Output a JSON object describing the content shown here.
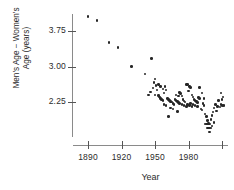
{
  "chart_data": {
    "type": "scatter",
    "title": "",
    "xlabel": "Year",
    "ylabel": "Men's Age − Women's Age (years)",
    "ylabel_line1": "Men's Age − Women's",
    "ylabel_line2": "Age (years)",
    "xticks": [
      1890,
      1920,
      1950,
      1980,
      2010
    ],
    "xtick_labels": [
      "1890",
      "1920",
      "1950",
      "1980",
      ""
    ],
    "yticks": [
      2.25,
      3.0,
      3.75
    ],
    "ytick_labels": [
      "2.25",
      "3.00",
      "3.75"
    ],
    "xlim": [
      1878,
      2014
    ],
    "ylim": [
      1.52,
      4.22
    ],
    "grid": false,
    "legend": false,
    "point_color": "#262626",
    "axis_color": "#8a8a8a",
    "points": [
      {
        "x": 1890,
        "y": 4.06
      },
      {
        "x": 1898,
        "y": 3.97
      },
      {
        "x": 1909,
        "y": 3.51
      },
      {
        "x": 1917,
        "y": 3.4
      },
      {
        "x": 1929,
        "y": 3.0
      },
      {
        "x": 1941,
        "y": 2.84
      },
      {
        "x": 1947,
        "y": 3.17
      },
      {
        "x": 1950,
        "y": 2.74
      },
      {
        "x": 1949,
        "y": 2.66
      },
      {
        "x": 1951,
        "y": 2.6
      },
      {
        "x": 1950,
        "y": 2.4
      },
      {
        "x": 1948,
        "y": 2.55
      },
      {
        "x": 1952,
        "y": 2.5
      },
      {
        "x": 1953,
        "y": 2.39
      },
      {
        "x": 1954,
        "y": 2.36
      },
      {
        "x": 1955,
        "y": 2.32
      },
      {
        "x": 1956,
        "y": 2.3
      },
      {
        "x": 1957,
        "y": 2.28
      },
      {
        "x": 1958,
        "y": 2.44
      },
      {
        "x": 1959,
        "y": 2.58
      },
      {
        "x": 1960,
        "y": 2.5
      },
      {
        "x": 1961,
        "y": 2.32
      },
      {
        "x": 1962,
        "y": 2.3
      },
      {
        "x": 1963,
        "y": 2.28
      },
      {
        "x": 1964,
        "y": 2.26
      },
      {
        "x": 1965,
        "y": 2.25
      },
      {
        "x": 1966,
        "y": 2.22
      },
      {
        "x": 1967,
        "y": 2.2
      },
      {
        "x": 1964,
        "y": 2.12
      },
      {
        "x": 1966,
        "y": 2.1
      },
      {
        "x": 1968,
        "y": 2.3
      },
      {
        "x": 1969,
        "y": 2.28
      },
      {
        "x": 1970,
        "y": 2.26
      },
      {
        "x": 1971,
        "y": 2.24
      },
      {
        "x": 1972,
        "y": 2.45
      },
      {
        "x": 1973,
        "y": 2.43
      },
      {
        "x": 1974,
        "y": 2.38
      },
      {
        "x": 1975,
        "y": 2.3
      },
      {
        "x": 1976,
        "y": 2.27
      },
      {
        "x": 1977,
        "y": 2.25
      },
      {
        "x": 1970,
        "y": 2.05
      },
      {
        "x": 1962,
        "y": 1.94
      },
      {
        "x": 1978,
        "y": 2.62
      },
      {
        "x": 1979,
        "y": 2.62
      },
      {
        "x": 1980,
        "y": 2.48
      },
      {
        "x": 1981,
        "y": 2.58
      },
      {
        "x": 1982,
        "y": 2.56
      },
      {
        "x": 1983,
        "y": 2.4
      },
      {
        "x": 1984,
        "y": 2.36
      },
      {
        "x": 1985,
        "y": 2.3
      },
      {
        "x": 1986,
        "y": 2.28
      },
      {
        "x": 1987,
        "y": 2.26
      },
      {
        "x": 1988,
        "y": 2.24
      },
      {
        "x": 1982,
        "y": 2.22
      },
      {
        "x": 1984,
        "y": 2.2
      },
      {
        "x": 1986,
        "y": 2.18
      },
      {
        "x": 1988,
        "y": 2.16
      },
      {
        "x": 1989,
        "y": 2.34
      },
      {
        "x": 1990,
        "y": 2.32
      },
      {
        "x": 1991,
        "y": 2.1
      },
      {
        "x": 1992,
        "y": 2.08
      },
      {
        "x": 1993,
        "y": 2.22
      },
      {
        "x": 1994,
        "y": 2.18
      },
      {
        "x": 1995,
        "y": 2.0
      },
      {
        "x": 1996,
        "y": 1.94
      },
      {
        "x": 1997,
        "y": 1.86
      },
      {
        "x": 1998,
        "y": 1.8
      },
      {
        "x": 1995,
        "y": 1.78
      },
      {
        "x": 1996,
        "y": 1.78
      },
      {
        "x": 1997,
        "y": 1.78
      },
      {
        "x": 1998,
        "y": 1.78
      },
      {
        "x": 1999,
        "y": 1.78
      },
      {
        "x": 1997,
        "y": 1.7
      },
      {
        "x": 1998,
        "y": 1.7
      },
      {
        "x": 1999,
        "y": 1.7
      },
      {
        "x": 2000,
        "y": 1.7
      },
      {
        "x": 1999,
        "y": 1.62
      },
      {
        "x": 2000,
        "y": 1.88
      },
      {
        "x": 2001,
        "y": 1.96
      },
      {
        "x": 2002,
        "y": 2.04
      },
      {
        "x": 2003,
        "y": 2.12
      },
      {
        "x": 2004,
        "y": 2.2
      },
      {
        "x": 2005,
        "y": 2.06
      },
      {
        "x": 2006,
        "y": 2.16
      },
      {
        "x": 2007,
        "y": 2.28
      },
      {
        "x": 2008,
        "y": 2.14
      },
      {
        "x": 2009,
        "y": 2.2
      },
      {
        "x": 2010,
        "y": 2.18
      },
      {
        "x": 2011,
        "y": 2.36
      },
      {
        "x": 2010,
        "y": 2.3
      },
      {
        "x": 2009,
        "y": 2.44
      },
      {
        "x": 2012,
        "y": 2.18
      },
      {
        "x": 2011,
        "y": 2.18
      },
      {
        "x": 1944,
        "y": 2.4
      },
      {
        "x": 1946,
        "y": 2.46
      },
      {
        "x": 1958,
        "y": 2.2
      },
      {
        "x": 1960,
        "y": 2.18
      },
      {
        "x": 1972,
        "y": 2.22
      },
      {
        "x": 1974,
        "y": 2.2
      },
      {
        "x": 1976,
        "y": 2.18
      },
      {
        "x": 1978,
        "y": 2.16
      },
      {
        "x": 1990,
        "y": 2.56
      },
      {
        "x": 1992,
        "y": 2.44
      },
      {
        "x": 1994,
        "y": 2.32
      },
      {
        "x": 1953,
        "y": 2.62
      },
      {
        "x": 1955,
        "y": 2.58
      },
      {
        "x": 1957,
        "y": 2.52
      },
      {
        "x": 1969,
        "y": 2.4
      },
      {
        "x": 1971,
        "y": 2.38
      },
      {
        "x": 1979,
        "y": 2.2
      },
      {
        "x": 1981,
        "y": 2.18
      },
      {
        "x": 1983,
        "y": 2.16
      },
      {
        "x": 2003,
        "y": 1.82
      },
      {
        "x": 2001,
        "y": 1.74
      }
    ]
  }
}
